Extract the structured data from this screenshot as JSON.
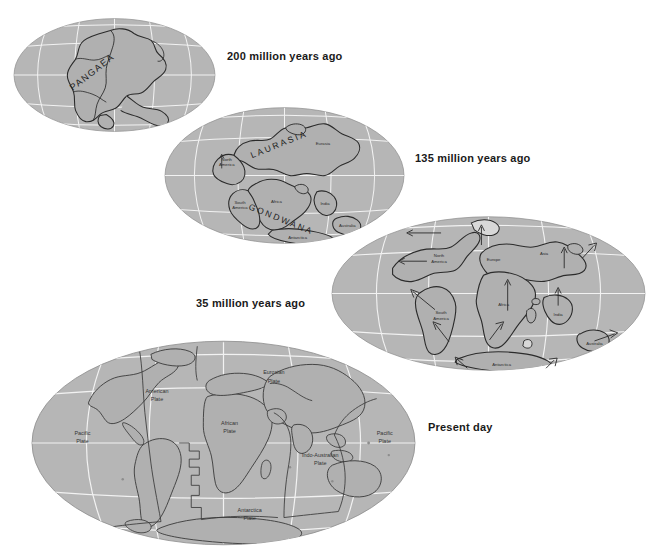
{
  "figure": {
    "colors": {
      "ocean": "#b6b6b6",
      "land": "#b0b0b0",
      "graticule": "#f2f2f2",
      "outline": "#2b2b2b",
      "label": "#2a2a2a",
      "time_label": "#1a1a1a",
      "background": "#ffffff"
    }
  },
  "maps": [
    {
      "id": "map-200my",
      "time_label": "200 million years ago",
      "supercontinents": [
        "PANGAEA"
      ],
      "continent_labels": []
    },
    {
      "id": "map-135my",
      "time_label": "135 million years ago",
      "supercontinents": [
        "LAURASIA",
        "GONDWANA"
      ],
      "continent_labels": [
        "North America",
        "Eurasia",
        "South America",
        "Africa",
        "India",
        "Australia",
        "Antarctica"
      ]
    },
    {
      "id": "map-35my",
      "time_label": "35 million years ago",
      "supercontinents": [],
      "continent_labels": [
        "North America",
        "Europe",
        "Asia",
        "South America",
        "Africa",
        "India",
        "Australia",
        "Antarctica"
      ]
    },
    {
      "id": "map-present",
      "time_label": "Present day",
      "supercontinents": [],
      "plate_labels": [
        "Pacific Plate",
        "American Plate",
        "Eurasian Plate",
        "African Plate",
        "Indo-Australian Plate",
        "Antarctica Plate",
        "Pacific Plate"
      ]
    }
  ],
  "labels": {
    "pangaea": "PANGAEA",
    "laurasia": "LAURASIA",
    "gondwana": "GONDWANA",
    "north_america": "North",
    "north_america2": "America",
    "eurasia": "Eurasia",
    "south_america": "South",
    "south_america2": "America",
    "africa": "Africa",
    "india": "India",
    "australia": "Australia",
    "antarctica": "Antarctica",
    "europe": "Europe",
    "asia": "Asia",
    "pacific": "Pacific",
    "plate": "Plate",
    "american": "American",
    "eurasian": "Eurosian",
    "african": "African",
    "indo_australian": "Indo-Australian",
    "antarctica_plate": "Antarctica",
    "time_200": "200 million years ago",
    "time_135": "135 million years ago",
    "time_35": "35 million years ago",
    "time_present": "Present day"
  }
}
